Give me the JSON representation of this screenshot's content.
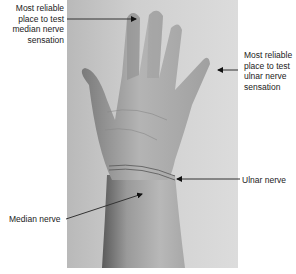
{
  "figure": {
    "labels": {
      "median_test": "Most reliable place to test median nerve sensation",
      "median_test_lines": [
        "Most reliable",
        "place to test",
        "median nerve",
        "sensation"
      ],
      "ulnar_test_lines": [
        "Most reliable",
        "place to test",
        "ulnar nerve",
        "sensation"
      ],
      "ulnar_nerve": "Ulnar nerve",
      "median_nerve": "Median nerve"
    },
    "colors": {
      "background": "#ffffff",
      "photo_bg": "#d2d2d2",
      "skin_light": "#bdbdbd",
      "skin_dark": "#6e6e6e",
      "text": "#222222",
      "arrow": "#111111"
    }
  }
}
